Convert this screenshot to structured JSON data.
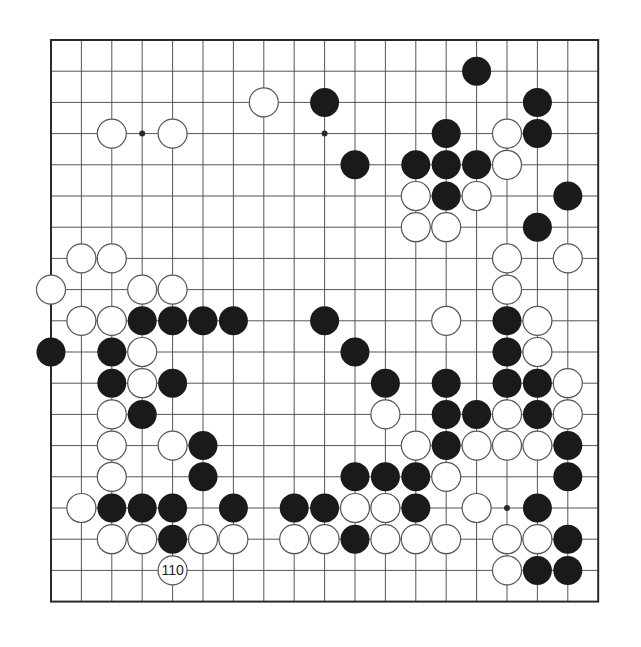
{
  "board": {
    "size": 19,
    "origin_x": 51,
    "origin_y": 40,
    "spacing_x": 30.4,
    "spacing_y": 31.2,
    "stone_radius": 14.5,
    "colors": {
      "line": "#555555",
      "border": "#2a2a2a",
      "black": "#1a1a1a",
      "white": "#ffffff",
      "white_outline": "#555555"
    }
  },
  "star_points": [
    [
      3,
      3
    ],
    [
      9,
      3
    ],
    [
      15,
      15
    ]
  ],
  "black_stones": [
    [
      14,
      1
    ],
    [
      9,
      2
    ],
    [
      16,
      2
    ],
    [
      13,
      3
    ],
    [
      16,
      3
    ],
    [
      10,
      4
    ],
    [
      12,
      4
    ],
    [
      13,
      4
    ],
    [
      14,
      4
    ],
    [
      13,
      5
    ],
    [
      17,
      5
    ],
    [
      16,
      6
    ],
    [
      3,
      9
    ],
    [
      4,
      9
    ],
    [
      5,
      9
    ],
    [
      6,
      9
    ],
    [
      9,
      9
    ],
    [
      15,
      9
    ],
    [
      0,
      10
    ],
    [
      2,
      10
    ],
    [
      10,
      10
    ],
    [
      15,
      10
    ],
    [
      2,
      11
    ],
    [
      4,
      11
    ],
    [
      11,
      11
    ],
    [
      13,
      11
    ],
    [
      15,
      11
    ],
    [
      16,
      11
    ],
    [
      3,
      12
    ],
    [
      13,
      12
    ],
    [
      14,
      12
    ],
    [
      16,
      12
    ],
    [
      5,
      13
    ],
    [
      13,
      13
    ],
    [
      17,
      13
    ],
    [
      5,
      14
    ],
    [
      10,
      14
    ],
    [
      11,
      14
    ],
    [
      12,
      14
    ],
    [
      17,
      14
    ],
    [
      2,
      15
    ],
    [
      3,
      15
    ],
    [
      4,
      15
    ],
    [
      6,
      15
    ],
    [
      8,
      15
    ],
    [
      9,
      15
    ],
    [
      12,
      15
    ],
    [
      16,
      15
    ],
    [
      4,
      16
    ],
    [
      10,
      16
    ],
    [
      17,
      16
    ],
    [
      16,
      17
    ],
    [
      17,
      17
    ]
  ],
  "white_stones": [
    [
      7,
      2
    ],
    [
      2,
      3
    ],
    [
      4,
      3
    ],
    [
      15,
      3
    ],
    [
      15,
      4
    ],
    [
      12,
      5
    ],
    [
      14,
      5
    ],
    [
      12,
      6
    ],
    [
      13,
      6
    ],
    [
      1,
      7
    ],
    [
      2,
      7
    ],
    [
      15,
      7
    ],
    [
      17,
      7
    ],
    [
      0,
      8
    ],
    [
      3,
      8
    ],
    [
      4,
      8
    ],
    [
      15,
      8
    ],
    [
      1,
      9
    ],
    [
      2,
      9
    ],
    [
      13,
      9
    ],
    [
      16,
      9
    ],
    [
      3,
      10
    ],
    [
      16,
      10
    ],
    [
      3,
      11
    ],
    [
      17,
      11
    ],
    [
      2,
      12
    ],
    [
      11,
      12
    ],
    [
      15,
      12
    ],
    [
      17,
      12
    ],
    [
      2,
      13
    ],
    [
      4,
      13
    ],
    [
      12,
      13
    ],
    [
      14,
      13
    ],
    [
      15,
      13
    ],
    [
      16,
      13
    ],
    [
      2,
      14
    ],
    [
      13,
      14
    ],
    [
      1,
      15
    ],
    [
      10,
      15
    ],
    [
      11,
      15
    ],
    [
      14,
      15
    ],
    [
      2,
      16
    ],
    [
      3,
      16
    ],
    [
      5,
      16
    ],
    [
      6,
      16
    ],
    [
      8,
      16
    ],
    [
      9,
      16
    ],
    [
      11,
      16
    ],
    [
      12,
      16
    ],
    [
      13,
      16
    ],
    [
      15,
      16
    ],
    [
      16,
      16
    ],
    [
      15,
      17
    ]
  ],
  "labeled_stones": [
    {
      "color": "white",
      "pos": [
        4,
        17
      ],
      "label": "110"
    }
  ]
}
